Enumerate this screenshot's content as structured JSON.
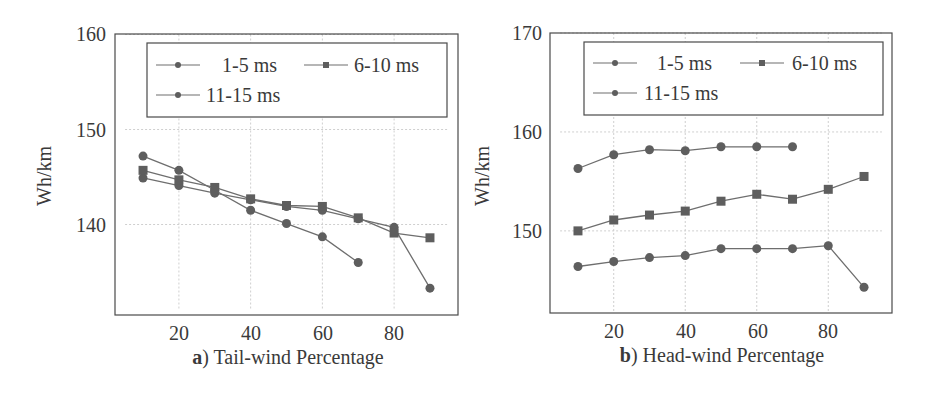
{
  "chart_data": [
    {
      "type": "line",
      "panel_label": "a)",
      "title": "",
      "xlabel": "Tail-wind Percentage",
      "ylabel": "Wh/km",
      "xlim": [
        5,
        95
      ],
      "ylim": [
        131,
        160
      ],
      "x_ticks": [
        20,
        40,
        60,
        80
      ],
      "y_ticks": [
        140,
        150,
        160
      ],
      "grid": true,
      "legend_position": "top-inside",
      "x": [
        10,
        20,
        30,
        40,
        50,
        60,
        70,
        80,
        90
      ],
      "series": [
        {
          "name": "1-5 ms",
          "marker": "circle",
          "x": [
            10,
            20,
            30,
            40,
            50,
            60,
            70,
            80,
            90
          ],
          "values": [
            144.9,
            144.1,
            143.3,
            142.6,
            141.9,
            141.5,
            140.6,
            139.7,
            133.3
          ]
        },
        {
          "name": "6-10 ms",
          "marker": "square",
          "x": [
            10,
            20,
            30,
            40,
            50,
            60,
            70,
            80,
            90
          ],
          "values": [
            145.7,
            144.7,
            143.9,
            142.7,
            142.0,
            141.9,
            140.7,
            139.1,
            138.6
          ]
        },
        {
          "name": "11-15 ms",
          "marker": "circle",
          "x": [
            10,
            20,
            30,
            40,
            50,
            60,
            70
          ],
          "values": [
            147.2,
            145.7,
            143.6,
            141.5,
            140.1,
            138.7,
            136.0
          ]
        }
      ]
    },
    {
      "type": "line",
      "panel_label": "b)",
      "title": "",
      "xlabel": "Head-wind Percentage",
      "ylabel": "Wh/km",
      "xlim": [
        5,
        95
      ],
      "ylim": [
        141.7,
        170
      ],
      "x_ticks": [
        20,
        40,
        60,
        80
      ],
      "y_ticks": [
        150,
        160,
        170
      ],
      "grid": true,
      "legend_position": "top-inside",
      "x": [
        10,
        20,
        30,
        40,
        50,
        60,
        70,
        80,
        90
      ],
      "series": [
        {
          "name": "1-5 ms",
          "marker": "circle",
          "x": [
            10,
            20,
            30,
            40,
            50,
            60,
            70,
            80,
            90
          ],
          "values": [
            146.4,
            146.9,
            147.3,
            147.5,
            148.2,
            148.2,
            148.2,
            148.5,
            144.3
          ]
        },
        {
          "name": "6-10 ms",
          "marker": "square",
          "x": [
            10,
            20,
            30,
            40,
            50,
            60,
            70,
            80,
            90
          ],
          "values": [
            150.0,
            151.1,
            151.6,
            152.0,
            153.0,
            153.7,
            153.2,
            154.2,
            155.5
          ]
        },
        {
          "name": "11-15 ms",
          "marker": "circle",
          "x": [
            10,
            20,
            30,
            40,
            50,
            60,
            70
          ],
          "values": [
            156.3,
            157.7,
            158.2,
            158.1,
            158.5,
            158.5,
            158.5
          ]
        }
      ]
    }
  ],
  "panels": [
    {
      "label_bold": "a",
      "label_rest": ") Tail-wind Percentage",
      "ylabel": "Wh/km",
      "legend": [
        "1-5 ms",
        "6-10 ms",
        "11-15 ms"
      ],
      "y_tick_labels": [
        "160",
        "150",
        "140"
      ],
      "x_tick_labels": [
        "20",
        "40",
        "60",
        "80"
      ]
    },
    {
      "label_bold": "b",
      "label_rest": ") Head-wind Percentage",
      "ylabel": "Wh/km",
      "legend": [
        "1-5 ms",
        "6-10 ms",
        "11-15 ms"
      ],
      "y_tick_labels": [
        "170",
        "160",
        "150"
      ],
      "x_tick_labels": [
        "20",
        "40",
        "60",
        "80"
      ]
    }
  ],
  "colors": {
    "line": "#6e6e6e",
    "marker": "#5e5e5e",
    "axis": "#4a4a4a",
    "grid": "#cfcfcf"
  }
}
